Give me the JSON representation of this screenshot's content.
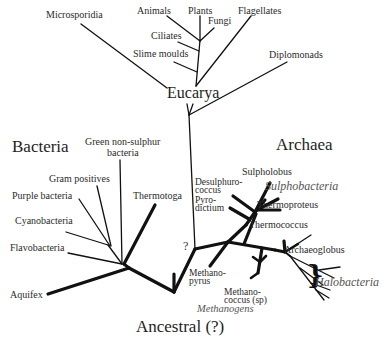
{
  "diagram": {
    "type": "phylogenetic-tree",
    "root_label": "Ancestral (?)",
    "line_color": "#111111",
    "italic_color": "#555555",
    "domains": [
      {
        "name": "Bacteria",
        "label": "Bacteria"
      },
      {
        "name": "Archaea",
        "label": "Archaea"
      },
      {
        "name": "Eucarya",
        "label": "Eucarya"
      }
    ],
    "eucarya": {
      "label": "Eucarya",
      "leaves": [
        "Microsporidia",
        "Animals",
        "Plants",
        "Fungi",
        "Flagellates",
        "Ciliates",
        "Slime moulds",
        "Diplomonads"
      ]
    },
    "bacteria": {
      "label": "Bacteria",
      "leaves": [
        "Green non-sulphur",
        "bacteria",
        "Gram positives",
        "Purple bacteria",
        "Cyanobacteria",
        "Flavobacteria",
        "Thermotoga",
        "Aquifex"
      ]
    },
    "archaea": {
      "label": "Archaea",
      "leaves": [
        "Sulpholobus",
        "Desulphuro-",
        "coccus",
        "Pyro-",
        "dictium",
        "Thermoproteus",
        "Thermococcus",
        "Archaeoglobus",
        "Methano-",
        "pyrus",
        "Methano-",
        "coccus (sp)"
      ],
      "groups": [
        "Sulphobacteria",
        "Halobacteria",
        "Methanogens"
      ]
    },
    "uncertain_marker": "?",
    "brace": "}"
  }
}
